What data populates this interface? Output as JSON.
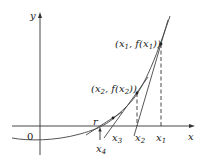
{
  "figure": {
    "axes": {
      "x_label": "x",
      "y_label": "y",
      "origin_label": "0"
    },
    "points": [
      {
        "name": "x1",
        "label": "(x1, f(x1))"
      },
      {
        "name": "x2",
        "label": "(x2, f(x2))"
      }
    ],
    "x_axis_marks": [
      "r",
      "x4",
      "x3",
      "x2",
      "x1"
    ],
    "labels": {
      "root": "r",
      "x1": "x",
      "x1_sub": "1",
      "x2": "x",
      "x2_sub": "2",
      "x3": "x",
      "x3_sub": "3",
      "x4": "x",
      "x4_sub": "4",
      "p1_open": "(x",
      "p1_sub": "1",
      "p1_mid": ", f(x",
      "p1_sub2": "1",
      "p1_close": "))",
      "p2_open": "(x",
      "p2_sub": "2",
      "p2_mid": ", f(x",
      "p2_sub2": "2",
      "p2_close": "))"
    },
    "colors": {
      "line": "#333333",
      "curve": "#555555",
      "background": "#ffffff"
    }
  }
}
